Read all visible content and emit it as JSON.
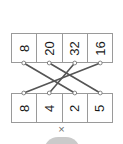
{
  "diagram": {
    "type": "matching-pairs",
    "orientation": "numbers-rotated-90deg",
    "top_row": {
      "name": "products-row",
      "cells": [
        {
          "value": "8",
          "index": 0
        },
        {
          "value": "20",
          "index": 1
        },
        {
          "value": "32",
          "index": 2
        },
        {
          "value": "16",
          "index": 3
        }
      ]
    },
    "bottom_row": {
      "name": "factors-row",
      "cells": [
        {
          "value": "8",
          "index": 0
        },
        {
          "value": "4",
          "index": 1
        },
        {
          "value": "2",
          "index": 2
        },
        {
          "value": "5",
          "index": 3
        }
      ]
    },
    "connections": [
      {
        "from_top": 0,
        "to_bottom": 2
      },
      {
        "from_top": 1,
        "to_bottom": 3
      },
      {
        "from_top": 2,
        "to_bottom": 1
      },
      {
        "from_top": 3,
        "to_bottom": 0
      }
    ],
    "operator": {
      "name": "multiply-symbol",
      "glyph": "×"
    }
  },
  "colors": {
    "line": "#555555",
    "node": "#ffffff",
    "node_border": "#777777",
    "cell_border": "#9a9a9a",
    "text": "#1a1a1a",
    "operator": "#6e6e6e",
    "bottom_shape": "#b8b8b8",
    "background": "#ffffff"
  }
}
